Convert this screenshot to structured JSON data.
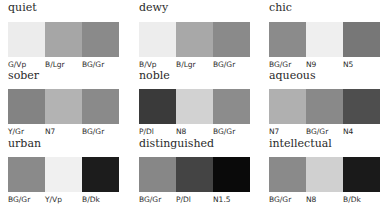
{
  "groups": [
    {
      "title": "quiet",
      "swatches": [
        {
          "label": "G/Vp",
          "color": "#ececec"
        },
        {
          "label": "B/Lgr",
          "color": "#a6a6a6"
        },
        {
          "label": "BG/Gr",
          "color": "#8a8a8a"
        }
      ]
    },
    {
      "title": "dewy",
      "swatches": [
        {
          "label": "B/Vp",
          "color": "#ededed"
        },
        {
          "label": "B/Lgr",
          "color": "#a8a8a8"
        },
        {
          "label": "BG/Gr",
          "color": "#8a8a8a"
        }
      ]
    },
    {
      "title": "chic",
      "swatches": [
        {
          "label": "BG/Gr",
          "color": "#8b8b8b"
        },
        {
          "label": "N9",
          "color": "#efefef"
        },
        {
          "label": "N5",
          "color": "#777777"
        }
      ]
    },
    {
      "title": "sober",
      "swatches": [
        {
          "label": "Y/Gr",
          "color": "#838383"
        },
        {
          "label": "N7",
          "color": "#b3b3b3"
        },
        {
          "label": "BG/Gr",
          "color": "#8a8a8a"
        }
      ]
    },
    {
      "title": "noble",
      "swatches": [
        {
          "label": "P/Dl",
          "color": "#3a3a3a"
        },
        {
          "label": "N8",
          "color": "#d2d2d2"
        },
        {
          "label": "BG/Gr",
          "color": "#8c8c8c"
        }
      ]
    },
    {
      "title": "aqueous",
      "swatches": [
        {
          "label": "N7",
          "color": "#b0b0b0"
        },
        {
          "label": "BG/Gr",
          "color": "#898989"
        },
        {
          "label": "N4",
          "color": "#4e4e4e"
        }
      ]
    },
    {
      "title": "urban",
      "swatches": [
        {
          "label": "BG/Gr",
          "color": "#8a8a8a"
        },
        {
          "label": "Y/Vp",
          "color": "#f0f0f0"
        },
        {
          "label": "B/Dk",
          "color": "#1c1c1c"
        }
      ]
    },
    {
      "title": "distinguished",
      "swatches": [
        {
          "label": "BG/Gr",
          "color": "#878787"
        },
        {
          "label": "P/Dl",
          "color": "#444444"
        },
        {
          "label": "N1.5",
          "color": "#0a0a0a"
        }
      ]
    },
    {
      "title": "intellectual",
      "swatches": [
        {
          "label": "BG/Gr",
          "color": "#8a8a8a"
        },
        {
          "label": "N8",
          "color": "#d0d0d0"
        },
        {
          "label": "B/Dk",
          "color": "#1a1a1a"
        }
      ]
    }
  ]
}
